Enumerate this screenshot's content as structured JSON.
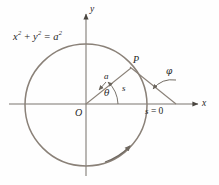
{
  "figure": {
    "type": "geometry-diagram",
    "background_color": "#fefefe",
    "stroke_color": "#8a8178",
    "axis_color": "#7a756e",
    "text_color": "#262626"
  },
  "labels": {
    "equation_lhs_x": "x",
    "equation_exp1": "2",
    "equation_plus": " + ",
    "equation_lhs_y": "y",
    "equation_exp2": "2",
    "equation_eq": " = ",
    "equation_rhs_a": "a",
    "equation_exp3": "2",
    "equation_full": "x² + y² = a²",
    "y_axis": "y",
    "x_axis": "x",
    "origin": "O",
    "point_p": "P",
    "radius": "a",
    "arc_length": "s",
    "theta": "θ",
    "phi": "φ",
    "arc_start": "s = 0"
  },
  "geometry": {
    "circle_center_x": 86,
    "circle_center_y": 105,
    "circle_radius": 61,
    "x_axis_y": 104,
    "y_axis_x": 86,
    "point_p_x": 131,
    "point_p_y": 69,
    "tangent_end_x": 176,
    "tangent_end_y": 104,
    "theta_degrees": 37,
    "phi_degrees": 141
  }
}
